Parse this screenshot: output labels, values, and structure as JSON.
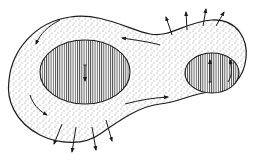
{
  "diagram": {
    "colors": {
      "background": "#ffffff",
      "ink": "#1a1a1a",
      "stipple": "#333333"
    },
    "outer_body": {
      "fill": "stippled",
      "path": "M 70 17 C 100 12 130 30 150 34 C 170 38 185 22 212 20 C 238 19 248 40 246 58 C 244 78 232 90 210 92 C 190 94 180 102 160 104 C 140 106 120 120 100 134 C 85 145 60 145 40 135 C 15 122 6 100 9 80 C 12 50 35 22 70 17 Z"
    },
    "ellipses": [
      {
        "id": "large-left",
        "cx": 85,
        "cy": 72,
        "rx": 45,
        "ry": 32,
        "fill": "vertical-hatch",
        "inner_arrow": {
          "x": 85,
          "y1": 65,
          "y2": 81,
          "style": "down-pointing, small tail mark"
        }
      },
      {
        "id": "small-right",
        "cx": 212,
        "cy": 73,
        "rx": 27,
        "ry": 20,
        "fill": "vertical-hatch",
        "inner_arrow": {
          "x": 210,
          "y1": 60,
          "y2": 82,
          "style": "up-pointing, small tail mark"
        }
      }
    ],
    "circulation_arrows": [
      {
        "id": "top-left-ccw",
        "path": "M 60 20 C 48 26 40 34 36 44",
        "head": "end"
      },
      {
        "id": "upper-neck-left",
        "path": "M 160 45 C 150 42 135 40 122 38",
        "head": "end"
      },
      {
        "id": "left-side-down",
        "path": "M 30 95 C 33 104 38 110 47 115",
        "head": "end"
      },
      {
        "id": "lower-neck-right",
        "path": "M 125 104 C 140 100 152 98 168 97",
        "head": "end"
      },
      {
        "id": "right-lobe-up",
        "path": "M 228 82 C 232 76 232 70 230 60",
        "head": "end"
      }
    ],
    "outward_arrows": {
      "top_right": [
        {
          "x1": 172,
          "y1": 35,
          "x2": 166,
          "y2": 17
        },
        {
          "x1": 187,
          "y1": 30,
          "x2": 186,
          "y2": 12
        },
        {
          "x1": 203,
          "y1": 26,
          "x2": 206,
          "y2": 9
        },
        {
          "x1": 216,
          "y1": 26,
          "x2": 224,
          "y2": 12
        }
      ],
      "bottom_left": [
        {
          "x1": 62,
          "y1": 124,
          "x2": 54,
          "y2": 144
        },
        {
          "x1": 76,
          "y1": 127,
          "x2": 72,
          "y2": 152
        },
        {
          "x1": 92,
          "y1": 127,
          "x2": 96,
          "y2": 150
        },
        {
          "x1": 106,
          "y1": 120,
          "x2": 112,
          "y2": 141
        }
      ]
    },
    "labels": []
  }
}
